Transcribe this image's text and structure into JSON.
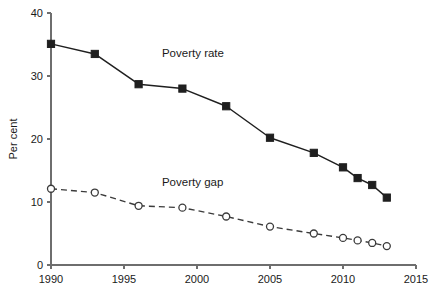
{
  "chart_data": {
    "type": "line",
    "title": "",
    "xlabel": "",
    "ylabel": "Per cent",
    "xlim": [
      1990,
      2015
    ],
    "ylim": [
      0,
      40
    ],
    "xticks": [
      1990,
      1995,
      2000,
      2005,
      2010,
      2015
    ],
    "xtick_labels": [
      "1990",
      "1995",
      "2000",
      "2005",
      "2010",
      "2015"
    ],
    "yticks": [
      0,
      10,
      20,
      30,
      40
    ],
    "ytick_labels": [
      "0",
      "10",
      "20",
      "30",
      "40"
    ],
    "grid": false,
    "legend_position": "inline-annotation",
    "x": [
      1990,
      1993,
      1996,
      1999,
      2002,
      2005,
      2008,
      2010,
      2011,
      2012,
      2013
    ],
    "series": [
      {
        "name": "Poverty rate",
        "marker": "filled-square",
        "line_style": "solid",
        "color": "#1f1f1f",
        "values": [
          35.1,
          33.5,
          28.7,
          28.0,
          25.2,
          20.2,
          17.8,
          15.5,
          13.8,
          12.7,
          10.7
        ],
        "label_x": 1997.6,
        "label_y": 33.0
      },
      {
        "name": "Poverty gap",
        "marker": "open-circle",
        "line_style": "dashed",
        "color": "#3b3b3b",
        "values": [
          12.1,
          11.5,
          9.4,
          9.1,
          7.7,
          6.1,
          5.0,
          4.3,
          3.9,
          3.5,
          3.0
        ],
        "label_x": 1997.6,
        "label_y": 12.6
      }
    ]
  },
  "annotations": {
    "poverty_rate_label": "Poverty rate",
    "poverty_gap_label": "Poverty gap",
    "y_axis_title": "Per cent"
  }
}
